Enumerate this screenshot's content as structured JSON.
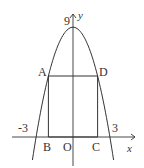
{
  "figure": {
    "top_cutoff_text": "",
    "axes": {
      "x_label": "x",
      "y_label": "y",
      "origin_label": "O"
    },
    "parabola": {
      "vertex_label": "9",
      "left_root_label": "-3",
      "right_root_label": "3",
      "vertex_y": 9,
      "roots": [
        -3,
        3
      ],
      "x_range": [
        -3.3,
        3.3
      ]
    },
    "rectangle": {
      "points": {
        "A": [
          -2,
          5
        ],
        "D": [
          2,
          5
        ],
        "B": [
          -2,
          0
        ],
        "C": [
          2,
          0
        ]
      },
      "labels": {
        "A": "A",
        "B": "B",
        "C": "C",
        "D": "D"
      }
    },
    "colors": {
      "stroke": "#333333"
    }
  }
}
